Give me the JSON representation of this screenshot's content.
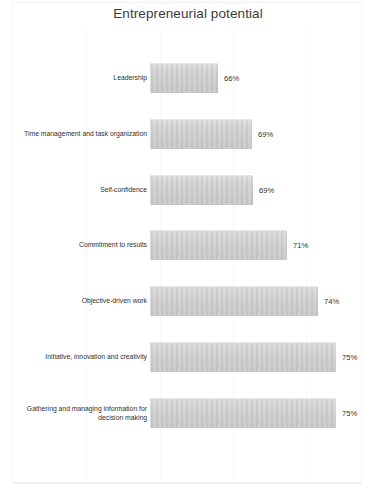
{
  "chart_title": "Entrepreneurial potential",
  "colors": {
    "bar_fill": "#cfcfcf",
    "bar_fill_light": "#dcdcdc",
    "text": "#2f2f2f",
    "title_text": "#3b3b3b",
    "background": "#ffffff",
    "frame": "#f4f4f4"
  },
  "chart_data": {
    "type": "bar",
    "orientation": "horizontal",
    "title": "Entrepreneurial potential",
    "xlabel": "",
    "ylabel": "",
    "grid": false,
    "legend": false,
    "value_suffix": "%",
    "xlim": [
      63,
      76
    ],
    "categories": [
      "Leadership",
      "Time management and task organization",
      "Self-confidence",
      "Commitment to results",
      "Objective-driven work",
      "Initiative, innovation and creativity",
      "Gathering and managing information for decision making"
    ],
    "values": [
      66,
      69,
      69,
      71,
      74,
      75,
      75
    ],
    "data_labels": [
      "66%",
      "69%",
      "69%",
      "71%",
      "74%",
      "75%",
      "75%"
    ],
    "bars": [
      {
        "label": "Leadership",
        "value": 66,
        "data_label": "66%",
        "pixel_width": 68
      },
      {
        "label": "Time management and task organization",
        "value": 69,
        "data_label": "69%",
        "pixel_width": 102
      },
      {
        "label": "Self-confidence",
        "value": 69,
        "data_label": "69%",
        "pixel_width": 103
      },
      {
        "label": "Commitment to results",
        "value": 71,
        "data_label": "71%",
        "pixel_width": 137
      },
      {
        "label": "Objective-driven work",
        "value": 74,
        "data_label": "74%",
        "pixel_width": 168
      },
      {
        "label": "Initiative, innovation and creativity",
        "value": 75,
        "data_label": "75%",
        "pixel_width": 186
      },
      {
        "label": "Gathering and managing information for decision making",
        "value": 75,
        "data_label": "75%",
        "pixel_width": 186
      }
    ]
  }
}
